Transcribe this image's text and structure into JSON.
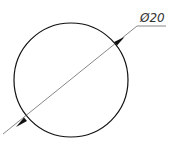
{
  "drawing": {
    "shape": "circle",
    "dimension_label": "Ø20",
    "dimension_type": "diameter",
    "colors": {
      "outline": "#111111",
      "dimension_line": "#555555",
      "text": "#333333",
      "background": "#ffffff"
    }
  }
}
